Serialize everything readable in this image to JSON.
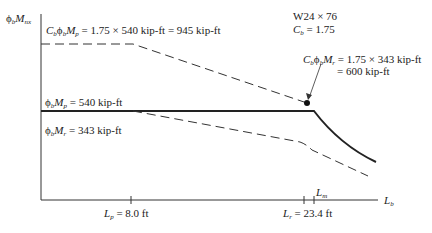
{
  "diagram": {
    "type": "moment-capacity-vs-unbraced-length",
    "section_label": "W24 × 76",
    "cb_label": "C",
    "cb_sub": "b",
    "cb_value": "= 1.75",
    "y_axis": {
      "symbol": "ϕ",
      "sym_sub": "b",
      "M": "M",
      "M_sub": "nx"
    },
    "x_axis": {
      "symbol": "L",
      "sub": "b"
    },
    "annotations": {
      "upper_plateau": {
        "text": "= 1.75 × 540 kip-ft = 945 kip-ft"
      },
      "mp": {
        "text": "= 540 kip-ft"
      },
      "mr": {
        "text": "= 343 kip-ft"
      },
      "cb_mr_line1": "= 1.75 × 343 kip-ft",
      "cb_mr_line2": "= 600 kip-ft"
    },
    "ticks": {
      "lp": {
        "sub": "p",
        "value": "= 8.0 ft"
      },
      "lr": {
        "sub": "r",
        "value": "= 23.4 ft"
      },
      "lm": {
        "sub": "m"
      }
    },
    "values": {
      "Cb": 1.75,
      "phiMp_kipft": 540,
      "phiMr_kipft": 343,
      "CbPhiMp_kipft": 945,
      "CbPhiMr_kipft": 600,
      "Lp_ft": 8.0,
      "Lr_ft": 23.4
    },
    "colors": {
      "line": "#222222",
      "dashed": "#333333"
    }
  }
}
